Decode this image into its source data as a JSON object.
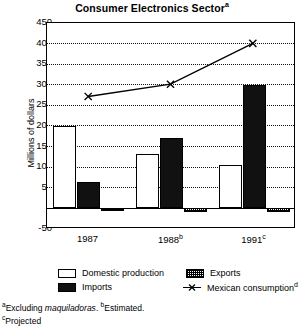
{
  "chart_data": {
    "type": "bar",
    "title": "Consumer Electronics Sector",
    "title_superscript": "a",
    "xlabel": "",
    "ylabel": "Millions of dollars",
    "ylim": [
      -50,
      450
    ],
    "ytick_step": 50,
    "ytick_labels": [
      "450",
      "400",
      "350",
      "300",
      "250",
      "200",
      "150",
      "100",
      "50",
      "0",
      "-50"
    ],
    "grid": true,
    "legend_position": "bottom",
    "categories": [
      "1987",
      "1988",
      "1991"
    ],
    "category_superscripts": [
      "",
      "b",
      "c"
    ],
    "series": [
      {
        "name": "Domestic production",
        "type": "bar",
        "values": [
          200,
          133,
          105
        ]
      },
      {
        "name": "Imports",
        "type": "bar",
        "values": [
          65,
          170,
          300
        ]
      },
      {
        "name": "Exports",
        "type": "bar",
        "values": [
          -5,
          -8,
          -8
        ]
      },
      {
        "name": "Mexican consumption",
        "type": "line",
        "values": [
          270,
          300,
          400
        ],
        "superscript": "d",
        "marker": "x"
      }
    ]
  },
  "title": {
    "text": "Consumer Electronics Sector",
    "superscript": "a"
  },
  "axes": {
    "y_title": "Millions of dollars",
    "y_ticks": [
      {
        "label": "450",
        "value": 450
      },
      {
        "label": "400",
        "value": 400
      },
      {
        "label": "350",
        "value": 350
      },
      {
        "label": "300",
        "value": 300
      },
      {
        "label": "250",
        "value": 250
      },
      {
        "label": "200",
        "value": 200
      },
      {
        "label": "150",
        "value": 150
      },
      {
        "label": "100",
        "value": 100
      },
      {
        "label": "50",
        "value": 50
      },
      {
        "label": "0",
        "value": 0
      },
      {
        "label": "-50",
        "value": -50
      }
    ],
    "x_ticks": [
      {
        "label": "1987",
        "superscript": ""
      },
      {
        "label": "1988",
        "superscript": "b"
      },
      {
        "label": "1991",
        "superscript": "c"
      }
    ]
  },
  "legend": {
    "entries": [
      {
        "label": "Domestic production",
        "swatch": "white-square",
        "superscript": ""
      },
      {
        "label": "Exports",
        "swatch": "hatched-square",
        "superscript": ""
      },
      {
        "label": "Imports",
        "swatch": "black-square",
        "superscript": ""
      },
      {
        "label": "Mexican consumption",
        "swatch": "line-x-marker",
        "superscript": "d"
      }
    ]
  },
  "footnotes": {
    "line1_a_marker": "a",
    "line1_part1": "Excluding ",
    "line1_italic": "maquiladoras",
    "line1_part2": ". ",
    "line1_b_marker": "b",
    "line1_part3": "Estimated.",
    "line2_c_marker": "c",
    "line2_text": "Projected"
  },
  "colors": {
    "domestic": "#ffffff",
    "imports": "#111111",
    "exports": "#000000",
    "line": "#000000",
    "axis": "#000000",
    "background": "#ffffff"
  }
}
